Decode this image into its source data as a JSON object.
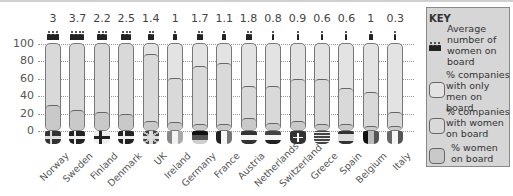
{
  "chart_data": {
    "type": "bar",
    "subtype": "stacked-capsule",
    "title": "",
    "xlabel": "",
    "ylabel": "",
    "ylim": [
      0,
      100
    ],
    "yticks": [
      0,
      20,
      40,
      60,
      80,
      100
    ],
    "grid": true,
    "legend_position": "right",
    "categories": [
      "Norway",
      "Sweden",
      "Finland",
      "Denmark",
      "UK",
      "Ireland",
      "Germany",
      "France",
      "Austria",
      "Netherlands",
      "Switzerland",
      "Greece",
      "Spain",
      "Belgium",
      "Italy"
    ],
    "series": [
      {
        "name": "Average number of women on board",
        "values": [
          3,
          3.7,
          2.2,
          2.5,
          1.4,
          1,
          1.7,
          1.1,
          1.8,
          0.8,
          0.9,
          0.6,
          0.6,
          1,
          0.3
        ]
      },
      {
        "name": "% companies with only men on board",
        "values": [
          0,
          0,
          0,
          0,
          14,
          41,
          28,
          24,
          50,
          50,
          43,
          42,
          53,
          58,
          80
        ]
      },
      {
        "name": "% companies with women on board",
        "values": [
          100,
          100,
          100,
          100,
          86,
          59,
          72,
          76,
          50,
          50,
          57,
          58,
          47,
          42,
          20
        ]
      },
      {
        "name": "% women on board",
        "values": [
          28,
          22,
          19,
          17,
          9,
          8,
          6,
          6,
          13,
          7,
          9,
          6,
          6,
          4,
          4
        ]
      }
    ]
  },
  "countries": [
    {
      "name": "Norway",
      "avg": "3",
      "flag": "norway"
    },
    {
      "name": "Sweden",
      "avg": "3.7",
      "flag": "sweden"
    },
    {
      "name": "Finland",
      "avg": "2.2",
      "flag": "finland"
    },
    {
      "name": "Denmark",
      "avg": "2.5",
      "flag": "denmark"
    },
    {
      "name": "UK",
      "avg": "1.4",
      "flag": "uk"
    },
    {
      "name": "Ireland",
      "avg": "1",
      "flag": "ireland"
    },
    {
      "name": "Germany",
      "avg": "1.7",
      "flag": "germany"
    },
    {
      "name": "France",
      "avg": "1.1",
      "flag": "france"
    },
    {
      "name": "Austria",
      "avg": "1.8",
      "flag": "austria"
    },
    {
      "name": "Netherlands",
      "avg": "0.8",
      "flag": "netherlands"
    },
    {
      "name": "Switzerland",
      "avg": "0.9",
      "flag": "switzerland"
    },
    {
      "name": "Greece",
      "avg": "0.6",
      "flag": "greece"
    },
    {
      "name": "Spain",
      "avg": "0.6",
      "flag": "spain"
    },
    {
      "name": "Belgium",
      "avg": "1",
      "flag": "belgium"
    },
    {
      "name": "Italy",
      "avg": "0.3",
      "flag": "italy"
    }
  ],
  "axis": {
    "ticks": [
      "100",
      "80",
      "60",
      "40",
      "20",
      "0"
    ]
  },
  "key": {
    "title": "KEY",
    "items": [
      {
        "label": "Average number of women on board",
        "icon": "women-figures-icon"
      },
      {
        "label": "% companies with only men on board",
        "swatch": "#e3e3e3"
      },
      {
        "label": "% companies with women on board",
        "swatch": "#d9d9d9"
      },
      {
        "label": "% women on board",
        "swatch": "#c9c9c9"
      }
    ]
  },
  "colors": {
    "only_men": "#e3e3e3",
    "with_women": "#d9d9d9",
    "women": "#c9c9c9",
    "key_bg": "#d6d6d6",
    "figure": "#222222"
  }
}
